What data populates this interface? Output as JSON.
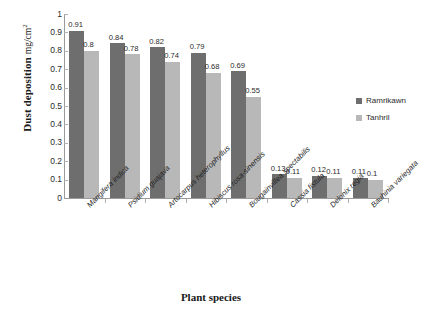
{
  "chart_data": {
    "type": "bar",
    "title": "",
    "xlabel": "Plant species",
    "ylabel": "Dust deposition",
    "ylabel_unit": "mg/cm",
    "ylabel_unit_sup": "2",
    "ylim": [
      0,
      1
    ],
    "ytick_step": 0.1,
    "yticks": [
      "1",
      "0.9",
      "0.8",
      "0.7",
      "0.6",
      "0.5",
      "0.4",
      "0.3",
      "0.2",
      "0.1",
      "0"
    ],
    "grid": false,
    "legend_position": "right",
    "categories": [
      "Mangifera indica",
      "Psidium guajava",
      "Artocarpus heterophyllus",
      "Hibiscus rosa-sinensis",
      "Bougainvillea spectabilis",
      "Cassia fistula",
      "Delonix regia",
      "Bauhinia variegata"
    ],
    "series": [
      {
        "name": "Ramrikawn",
        "color": "#6e6e6e",
        "values": [
          0.91,
          0.84,
          0.82,
          0.79,
          0.69,
          0.13,
          0.12,
          0.11
        ],
        "labels": [
          "0.91",
          "0.84",
          "0.82",
          "0.79",
          "0.69",
          "0.13",
          "0.12",
          "0.11"
        ]
      },
      {
        "name": "Tanhril",
        "color": "#b8b8b8",
        "values": [
          0.8,
          0.78,
          0.74,
          0.68,
          0.55,
          0.11,
          0.11,
          0.1
        ],
        "labels": [
          "0.8",
          "0.78",
          "0.74",
          "0.68",
          "0.55",
          "0.11",
          "0.11",
          "0.1"
        ]
      }
    ]
  }
}
